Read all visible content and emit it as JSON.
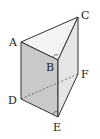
{
  "diagram": {
    "type": "triangular-prism",
    "vertices": {
      "A": {
        "label": "A",
        "x": 21,
        "y": 42
      },
      "B": {
        "label": "B",
        "x": 58,
        "y": 60
      },
      "C": {
        "label": "C",
        "x": 78,
        "y": 17
      },
      "D": {
        "label": "D",
        "x": 21,
        "y": 99
      },
      "E": {
        "label": "E",
        "x": 58,
        "y": 117
      },
      "F": {
        "label": "F",
        "x": 78,
        "y": 74
      }
    },
    "right_angle_marks": [
      "B",
      "E"
    ],
    "hidden_edges": [
      "D-F"
    ],
    "colors": {
      "stroke": "#333333",
      "face_front": "#c8c8c8",
      "face_side": "#e4e4e4",
      "face_top": "#f0f0f0"
    }
  }
}
